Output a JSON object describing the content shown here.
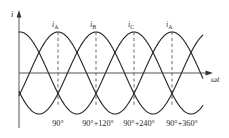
{
  "figure": {
    "axes": {
      "y_label": "i",
      "x_label": "ωt",
      "y_arrow_icon": "arrow-up-icon",
      "x_arrow_icon": "arrow-right-icon"
    },
    "peak_labels": [
      {
        "base": "i",
        "sub": "A"
      },
      {
        "base": "i",
        "sub": "B"
      },
      {
        "base": "i",
        "sub": "C"
      },
      {
        "base": "i",
        "sub": "A"
      }
    ],
    "tick_labels": [
      "90°",
      "90°+120°",
      "90°+240°",
      "90°+360°"
    ],
    "colors": {
      "background": "#ffffff",
      "curve": "#2b2b2b",
      "axis": "#555555",
      "dashed": "#5a5a5a",
      "text": "#1f1f1f"
    }
  },
  "chart_data": {
    "type": "line",
    "xlabel": "ωt",
    "ylabel": "i",
    "grid": false,
    "legend": "none",
    "xlim": [
      0,
      465
    ],
    "ylim": [
      -1.15,
      1.15
    ],
    "x_unit": "degrees",
    "x_tick_values": [
      90,
      210,
      330,
      450
    ],
    "x_tick_labels": [
      "90°",
      "90°+120°",
      "90°+240°",
      "90°+360°"
    ],
    "amplitude": 1,
    "period_degrees": 360,
    "series": [
      {
        "name": "i_A",
        "label": "iA",
        "phase_degrees": 0,
        "formula": "sin(wt)",
        "peaks_at_degrees": [
          90,
          450
        ],
        "troughs_at_degrees": [
          270
        ]
      },
      {
        "name": "i_B",
        "label": "iB",
        "phase_degrees": -120,
        "formula": "sin(wt - 120)",
        "peaks_at_degrees": [
          210
        ],
        "troughs_at_degrees": [
          30,
          390
        ]
      },
      {
        "name": "i_C",
        "label": "iC",
        "phase_degrees": -240,
        "formula": "sin(wt - 240)",
        "peaks_at_degrees": [
          330
        ],
        "troughs_at_degrees": [
          150
        ]
      }
    ],
    "peak_annotations": [
      {
        "label": "iA",
        "x_degrees": 90,
        "y": 1
      },
      {
        "label": "iB",
        "x_degrees": 210,
        "y": 1
      },
      {
        "label": "iC",
        "x_degrees": 330,
        "y": 1
      },
      {
        "label": "iA",
        "x_degrees": 450,
        "y": 1
      }
    ],
    "dashed_drop_lines": [
      {
        "x_degrees": 90,
        "from_y": 1,
        "to_y": -1
      },
      {
        "x_degrees": 210,
        "from_y": 1,
        "to_y": -1
      },
      {
        "x_degrees": 330,
        "from_y": 1,
        "to_y": -1
      },
      {
        "x_degrees": 450,
        "from_y": 1,
        "to_y": -1
      }
    ]
  }
}
